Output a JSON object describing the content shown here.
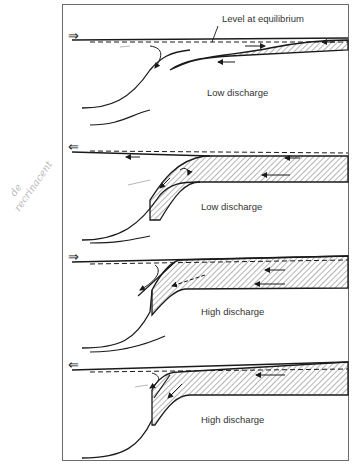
{
  "figure": {
    "annotation_top": "Level at equilibrium",
    "panels": [
      {
        "label": "Low discharge",
        "flow_direction": "inflow",
        "arrow_glyph": "⇒"
      },
      {
        "label": "Low discharge",
        "flow_direction": "outflow",
        "arrow_glyph": "⇐"
      },
      {
        "label": "High discharge",
        "flow_direction": "inflow",
        "arrow_glyph": "⇒"
      },
      {
        "label": "High discharge",
        "flow_direction": "outflow",
        "arrow_glyph": "⇐"
      }
    ],
    "handwritten_note": [
      "de",
      "recrinacent"
    ]
  },
  "colors": {
    "line": "#1a1a1a",
    "frame": "#6b6b6b",
    "hatch": "#444444",
    "pencil": "#b8b8b8"
  }
}
